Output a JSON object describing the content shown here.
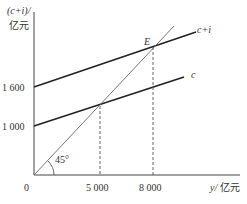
{
  "chart_data": {
    "type": "line",
    "title": "",
    "ylabel_top": "(c+i)/",
    "ylabel_unit": "亿元",
    "xlabel_var": "y/",
    "xlabel_unit": "亿元",
    "origin_label": "0",
    "xlim": [
      0,
      10000
    ],
    "ylim": [
      0,
      2800
    ],
    "x_ticks": [
      {
        "value": 5000,
        "label": "5 000"
      },
      {
        "value": 8000,
        "label": "8 000"
      }
    ],
    "y_ticks": [
      {
        "value": 1000,
        "label": "1 000"
      },
      {
        "value": 1600,
        "label": "1 600"
      }
    ],
    "series": [
      {
        "name": "c",
        "label": "c",
        "intercept": 1000,
        "slope": 0.2,
        "x": [
          0,
          8800
        ],
        "y": [
          1000,
          2760
        ]
      },
      {
        "name": "c+i",
        "label": "c+i",
        "intercept": 1600,
        "slope": 0.2,
        "x": [
          0,
          8800
        ],
        "y": [
          1600,
          3360
        ]
      },
      {
        "name": "45-degree line",
        "label": "",
        "slope": 1,
        "x": [
          0,
          9400
        ],
        "y": [
          0,
          9400
        ]
      }
    ],
    "annotations": [
      {
        "text": "E",
        "x": 8000,
        "y": 3200,
        "type": "equilibrium-point"
      },
      {
        "text": "45°",
        "type": "angle-label"
      }
    ],
    "guides": [
      {
        "x": 5000,
        "style": "dashed"
      },
      {
        "x": 8000,
        "style": "dashed"
      }
    ],
    "grid": false
  }
}
